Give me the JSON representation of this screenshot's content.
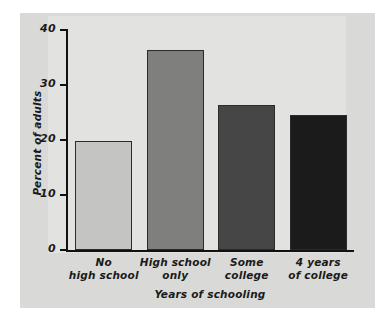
{
  "chart_data": {
    "type": "bar",
    "title": "",
    "xlabel": "Years of schooling",
    "ylabel": "Percent of adults",
    "categories": [
      "No high school",
      "High school only",
      "Some college",
      "4 years of college"
    ],
    "category_lines": [
      [
        "No",
        "high school"
      ],
      [
        "High school",
        "only"
      ],
      [
        "Some",
        "college"
      ],
      [
        "4 years",
        "of college"
      ]
    ],
    "values": [
      19.7,
      36.2,
      26.2,
      24.5
    ],
    "ylim": [
      0,
      40
    ],
    "yticks": [
      0,
      10,
      20,
      30,
      40
    ],
    "ytick_labels": [
      "0",
      "10",
      "20",
      "30",
      "40"
    ],
    "grid": false,
    "legend": false,
    "bar_colors": [
      "#c4c4c2",
      "#7f7f7d",
      "#464646",
      "#1b1b1b"
    ],
    "bar_edge_color": "#2b2b2b",
    "axis_color": "#111111",
    "panel_color": "#d9d9d7",
    "plot_bg_color": "#e2e2e0",
    "page_bg_color": "#ffffff"
  }
}
